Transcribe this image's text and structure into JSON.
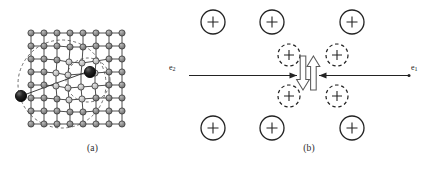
{
  "figure": {
    "panels": [
      {
        "id": "a",
        "caption": "(a)",
        "description": "polaron-lattice-deformation",
        "lattice": {
          "columns": 8,
          "rows": 8,
          "node_fill": "#8e8e8e",
          "node_stroke": "#3a3a3a",
          "bond_color": "#3a3a3a",
          "distorted_node_fill": "#c9c9c9"
        },
        "particles": [
          {
            "name": "polaron-left",
            "label": "",
            "fill": "#1a1a1a"
          },
          {
            "name": "polaron-right",
            "label": "",
            "fill": "#1a1a1a"
          }
        ],
        "deformation_regions": [
          {
            "name": "deformation-ellipse-large",
            "style": "dashed"
          },
          {
            "name": "deformation-ellipse-small",
            "style": "dashed"
          }
        ]
      },
      {
        "id": "b",
        "caption": "(b)",
        "description": "cooper-pair-ion-displacement",
        "ion_charge": "+",
        "ions_solid": [
          {
            "name": "ion-top-left-1",
            "cx": 28,
            "cy": 22
          },
          {
            "name": "ion-top-left-2",
            "cx": 87,
            "cy": 22
          },
          {
            "name": "ion-top-right-1",
            "cx": 167,
            "cy": 22
          },
          {
            "name": "ion-bot-left-1",
            "cx": 28,
            "cy": 128
          },
          {
            "name": "ion-bot-left-2",
            "cx": 87,
            "cy": 128
          },
          {
            "name": "ion-bot-right-1",
            "cx": 167,
            "cy": 128
          }
        ],
        "ions_dashed": [
          {
            "name": "ion-displaced-top-left",
            "cx": 104,
            "cy": 55
          },
          {
            "name": "ion-displaced-top-right",
            "cx": 152,
            "cy": 55
          },
          {
            "name": "ion-displaced-bot-left",
            "cx": 104,
            "cy": 96
          },
          {
            "name": "ion-displaced-bot-right",
            "cx": 152,
            "cy": 96
          }
        ],
        "electrons": [
          {
            "name": "electron-e2",
            "label": "e",
            "subscript": "2",
            "direction": "right"
          },
          {
            "name": "electron-e1",
            "label": "e",
            "subscript": "1",
            "direction": "left"
          }
        ],
        "spins": [
          {
            "name": "spin-down-arrow",
            "direction": "down"
          },
          {
            "name": "spin-up-arrow",
            "direction": "up"
          }
        ]
      }
    ],
    "colors": {
      "ink": "#232323",
      "lattice_node": "#8e8e8e",
      "lattice_node_light": "#c9c9c9",
      "particle": "#1a1a1a",
      "background": "#ffffff"
    }
  }
}
